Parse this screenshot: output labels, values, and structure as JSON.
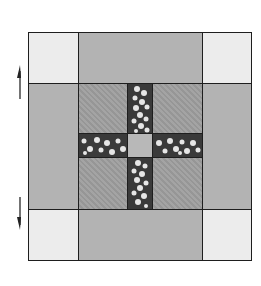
{
  "diagram": {
    "type": "quilt-block",
    "colors": {
      "corner": "#ececec",
      "border": "#b3b3b3",
      "inner": "#9e9e9e",
      "strip": "#3a3a3a",
      "speckle": "#e6e6e6",
      "center": "#b8b8b8",
      "outline": "#1e1e1e"
    },
    "arrows": [
      {
        "direction": "up",
        "label": ""
      },
      {
        "direction": "down",
        "label": ""
      }
    ]
  }
}
